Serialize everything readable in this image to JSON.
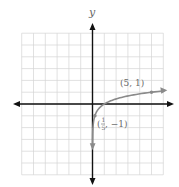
{
  "chart_data": {
    "type": "line",
    "title": "",
    "function": "y = log_5(x)",
    "xlabel": "",
    "ylabel": "y",
    "xlim": [
      -6,
      6
    ],
    "ylim": [
      -6,
      6
    ],
    "grid": true,
    "legend": null,
    "series": [
      {
        "name": "log base 5 of x",
        "color": "#8a8a8a",
        "points": [
          {
            "x": 0.005,
            "y": -3.29
          },
          {
            "x": 0.01,
            "y": -2.86
          },
          {
            "x": 0.04,
            "y": -2.0
          },
          {
            "x": 0.2,
            "y": -1.0
          },
          {
            "x": 0.5,
            "y": -0.43
          },
          {
            "x": 1,
            "y": 0
          },
          {
            "x": 2,
            "y": 0.43
          },
          {
            "x": 3,
            "y": 0.68
          },
          {
            "x": 4,
            "y": 0.86
          },
          {
            "x": 5,
            "y": 1.0
          },
          {
            "x": 6,
            "y": 1.11
          }
        ]
      }
    ],
    "annotations": [
      {
        "point": [
          5,
          1
        ],
        "text": "(5, 1)"
      },
      {
        "point": [
          0.2,
          -1
        ],
        "text_parts": {
          "open": "(",
          "num": "1",
          "den": "5",
          "rest": ", −1)"
        }
      }
    ]
  },
  "labels": {
    "y_axis": "y",
    "point_a": "(5, 1)",
    "point_b_open": "(",
    "point_b_num": "1",
    "point_b_den": "5",
    "point_b_rest": ", −1)"
  },
  "colors": {
    "axis": "#111111",
    "grid": "#d4d4d4",
    "curve": "#8a8a8a",
    "label": "#6a6a6a"
  }
}
